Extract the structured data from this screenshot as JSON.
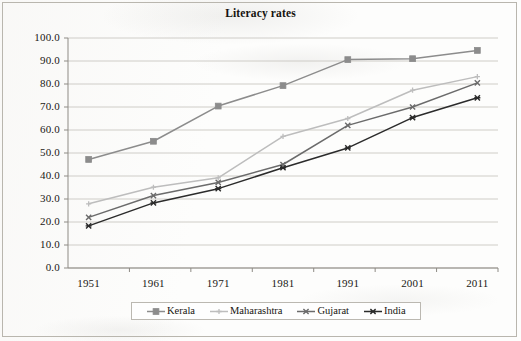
{
  "chart_data": {
    "type": "line",
    "title": "Literacy rates",
    "xlabel": "",
    "ylabel": "",
    "x": [
      "1951",
      "1961",
      "1971",
      "1981",
      "1991",
      "2001",
      "2011"
    ],
    "categories": [
      "1951",
      "1961",
      "1971",
      "1981",
      "1991",
      "2001",
      "2011"
    ],
    "ylim": [
      0.0,
      100.0
    ],
    "yticks": [
      "0.0",
      "10.0",
      "20.0",
      "30.0",
      "40.0",
      "50.0",
      "60.0",
      "70.0",
      "80.0",
      "90.0",
      "100.0"
    ],
    "ytick_values": [
      0,
      10,
      20,
      30,
      40,
      50,
      60,
      70,
      80,
      90,
      100
    ],
    "grid": "horizontal",
    "legend_position": "bottom",
    "series": [
      {
        "name": "Kerala",
        "color": "#8c8c8c",
        "marker": "square",
        "values": [
          47.2,
          55.1,
          70.4,
          79.3,
          90.6,
          91.0,
          94.6
        ]
      },
      {
        "name": "Maharashtra",
        "color": "#bdbdbd",
        "marker": "plus",
        "values": [
          27.9,
          35.1,
          39.2,
          57.2,
          65.0,
          77.3,
          83.2
        ]
      },
      {
        "name": "Gujarat",
        "color": "#6b6b6b",
        "marker": "cross",
        "values": [
          22.0,
          31.5,
          37.2,
          45.0,
          62.0,
          70.0,
          80.5
        ]
      },
      {
        "name": "India",
        "color": "#2b2b2b",
        "marker": "asterisk",
        "values": [
          18.3,
          28.3,
          34.5,
          43.6,
          52.2,
          65.4,
          74.0
        ]
      }
    ]
  },
  "legend": {
    "items": [
      {
        "label": "Kerala"
      },
      {
        "label": "Maharashtra"
      },
      {
        "label": "Gujarat"
      },
      {
        "label": "India"
      }
    ]
  }
}
